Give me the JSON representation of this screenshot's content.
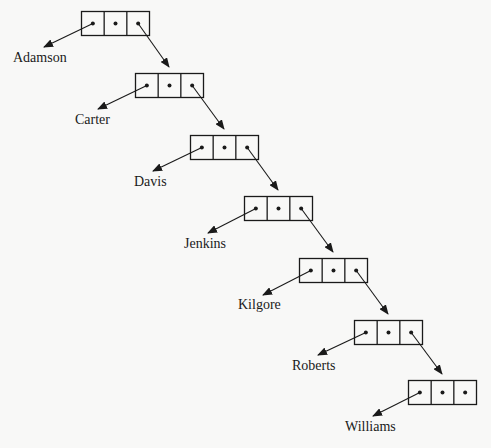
{
  "diagram": {
    "type": "linked-list",
    "colors": {
      "stroke": "#1a1a1a",
      "background": "#f8f8f7",
      "text": "#1a1a1a"
    },
    "node_size": {
      "width": 68,
      "height": 24,
      "cells": 3
    },
    "nodes": [
      {
        "label": "Adamson",
        "box": {
          "x": 81,
          "y": 11
        },
        "label_pos": {
          "x": 13,
          "y": 62
        },
        "data_arrow_tip": {
          "x": 44,
          "y": 47
        }
      },
      {
        "label": "Carter",
        "box": {
          "x": 135,
          "y": 73
        },
        "label_pos": {
          "x": 75,
          "y": 124
        },
        "data_arrow_tip": {
          "x": 98,
          "y": 109
        }
      },
      {
        "label": "Davis",
        "box": {
          "x": 190,
          "y": 135
        },
        "label_pos": {
          "x": 134,
          "y": 186
        },
        "data_arrow_tip": {
          "x": 153,
          "y": 171
        }
      },
      {
        "label": "Jenkins",
        "box": {
          "x": 244,
          "y": 196
        },
        "label_pos": {
          "x": 184,
          "y": 248
        },
        "data_arrow_tip": {
          "x": 208,
          "y": 233
        }
      },
      {
        "label": "Kilgore",
        "box": {
          "x": 299,
          "y": 258
        },
        "label_pos": {
          "x": 238,
          "y": 309
        },
        "data_arrow_tip": {
          "x": 263,
          "y": 295
        }
      },
      {
        "label": "Roberts",
        "box": {
          "x": 354,
          "y": 320
        },
        "label_pos": {
          "x": 292,
          "y": 370
        },
        "data_arrow_tip": {
          "x": 318,
          "y": 355
        }
      },
      {
        "label": "Williams",
        "box": {
          "x": 408,
          "y": 380
        },
        "label_pos": {
          "x": 345,
          "y": 431
        },
        "data_arrow_tip": {
          "x": 373,
          "y": 416
        }
      }
    ]
  }
}
